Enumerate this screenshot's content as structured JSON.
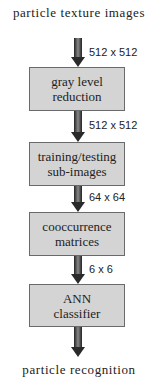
{
  "input_label": "particle texture images",
  "output_label": "particle recognition",
  "steps": [
    {
      "line1": "gray level",
      "line2": "reduction"
    },
    {
      "line1": "training/testing",
      "line2": "sub-images"
    },
    {
      "line1": "cooccurrence",
      "line2": "matrices"
    },
    {
      "line1": "ANN",
      "line2": "classifier"
    }
  ],
  "dimensions": [
    "512 x 512",
    "512 x 512",
    "64 x 64",
    "6 x 6"
  ],
  "colors": {
    "box_fill": "#d4d4d4",
    "box_border": "#6a6a6a",
    "arrow": "#3a3a3a"
  }
}
